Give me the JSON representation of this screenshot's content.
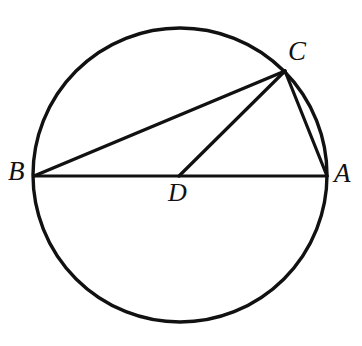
{
  "figure": {
    "background_color": "#ffffff",
    "stroke_color": "#111111",
    "width": 362,
    "height": 346
  },
  "circle": {
    "name": "circumference",
    "center_x": 180,
    "center_y": 175,
    "radius": 147,
    "stroke_width": 3.4
  },
  "points": {
    "A": {
      "label": "A",
      "x": 327,
      "y": 176,
      "role": "endpoint-of-diameter"
    },
    "B": {
      "label": "B",
      "x": 34,
      "y": 176,
      "role": "endpoint-of-diameter"
    },
    "C": {
      "label": "C",
      "x": 285,
      "y": 71,
      "role": "point-on-circle"
    },
    "D": {
      "label": "D",
      "x": 179,
      "y": 176,
      "role": "center"
    }
  },
  "segments": [
    {
      "name": "BA",
      "from": "B",
      "to": "A",
      "x1": 34,
      "y1": 176,
      "x2": 327,
      "y2": 176,
      "stroke_width": 3.2,
      "description": "diameter"
    },
    {
      "name": "BC",
      "from": "B",
      "to": "C",
      "x1": 34,
      "y1": 176,
      "x2": 285,
      "y2": 71,
      "stroke_width": 3.4,
      "description": "chord"
    },
    {
      "name": "DC",
      "from": "D",
      "to": "C",
      "x1": 179,
      "y1": 176,
      "x2": 285,
      "y2": 71,
      "stroke_width": 3.2,
      "description": "radius"
    },
    {
      "name": "CA",
      "from": "C",
      "to": "A",
      "x1": 285,
      "y1": 71,
      "x2": 327,
      "y2": 176,
      "stroke_width": 3.2,
      "description": "chord"
    }
  ],
  "labels": {
    "A": "A",
    "B": "B",
    "C": "C",
    "D": "D"
  }
}
